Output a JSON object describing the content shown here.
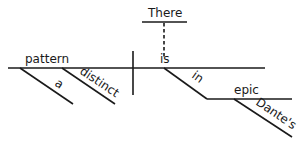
{
  "diagram": {
    "type": "sentence-diagram",
    "sentence": "There is a distinct pattern in Dante's epic",
    "subject": {
      "word": "pattern",
      "modifiers": [
        "a",
        "distinct"
      ]
    },
    "predicate": {
      "word": "is",
      "expletive": "There",
      "prepositional_phrase": {
        "preposition": "in",
        "object": "epic",
        "object_modifiers": [
          "Dante's"
        ]
      }
    }
  },
  "colors": {
    "ink": "#1a1a1a",
    "background": "#ffffff"
  }
}
